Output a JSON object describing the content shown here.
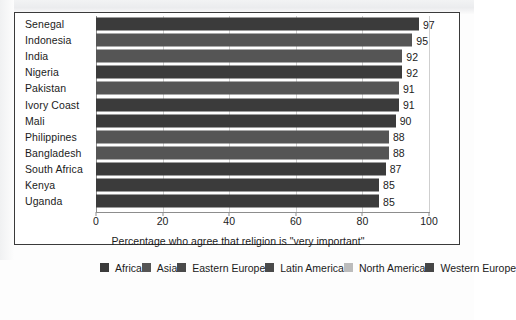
{
  "chart_data": {
    "type": "bar",
    "orientation": "horizontal",
    "title": "",
    "xlabel": "Percentage who agree that religion is \"very important\"",
    "ylabel": "",
    "xlim": [
      0,
      100
    ],
    "xticks": [
      0,
      20,
      40,
      60,
      80,
      100
    ],
    "grid": true,
    "grid_axis": "x",
    "legend_position": "bottom",
    "categories": [
      "Senegal",
      "Indonesia",
      "India",
      "Nigeria",
      "Pakistan",
      "Ivory Coast",
      "Mali",
      "Philippines",
      "Bangladesh",
      "South Africa",
      "Kenya",
      "Uganda"
    ],
    "values": [
      97,
      95,
      92,
      92,
      91,
      91,
      90,
      88,
      88,
      87,
      85,
      85
    ],
    "value_labels": [
      "97",
      "95",
      "92",
      "92",
      "91",
      "91",
      "90",
      "88",
      "88",
      "87",
      "85",
      "85"
    ],
    "bars": [
      {
        "label": "Senegal",
        "value": 97,
        "value_label": "97",
        "region": "Africa",
        "color": "#3b3b3b"
      },
      {
        "label": "Indonesia",
        "value": 95,
        "value_label": "95",
        "region": "Asia",
        "color": "#555555"
      },
      {
        "label": "India",
        "value": 92,
        "value_label": "92",
        "region": "Asia",
        "color": "#555555"
      },
      {
        "label": "Nigeria",
        "value": 92,
        "value_label": "92",
        "region": "Africa",
        "color": "#3b3b3b"
      },
      {
        "label": "Pakistan",
        "value": 91,
        "value_label": "91",
        "region": "Asia",
        "color": "#555555"
      },
      {
        "label": "Ivory Coast",
        "value": 91,
        "value_label": "91",
        "region": "Africa",
        "color": "#3b3b3b"
      },
      {
        "label": "Mali",
        "value": 90,
        "value_label": "90",
        "region": "Africa",
        "color": "#3b3b3b"
      },
      {
        "label": "Philippines",
        "value": 88,
        "value_label": "88",
        "region": "Asia",
        "color": "#555555"
      },
      {
        "label": "Bangladesh",
        "value": 88,
        "value_label": "88",
        "region": "Asia",
        "color": "#555555"
      },
      {
        "label": "South Africa",
        "value": 87,
        "value_label": "87",
        "region": "Africa",
        "color": "#3b3b3b"
      },
      {
        "label": "Kenya",
        "value": 85,
        "value_label": "85",
        "region": "Africa",
        "color": "#3b3b3b"
      },
      {
        "label": "Uganda",
        "value": 85,
        "value_label": "85",
        "region": "Africa",
        "color": "#3b3b3b"
      }
    ],
    "legend": [
      {
        "label": "Africa",
        "color": "#3b3b3b"
      },
      {
        "label": "Asia",
        "color": "#555555"
      },
      {
        "label": "Eastern Europe",
        "color": "#4a4a4a"
      },
      {
        "label": "Latin America",
        "color": "#4a4a4a"
      },
      {
        "label": "North America",
        "color": "#bcbcbc"
      },
      {
        "label": "Western Europe",
        "color": "#464646"
      }
    ]
  },
  "colors": {
    "panel_border": "#3a3a3a",
    "gridline": "#cfcfcf",
    "axis": "#8d8d8d",
    "text": "#1b1b1b",
    "background": "#ffffff"
  }
}
